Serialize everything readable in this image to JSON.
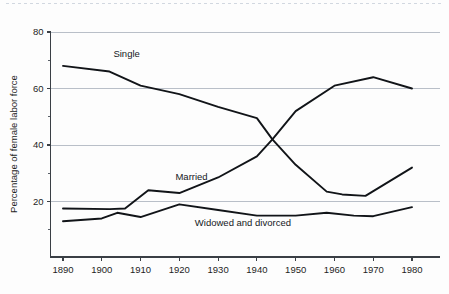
{
  "chart_data": {
    "type": "line",
    "title": "",
    "xlabel": "",
    "ylabel": "Percentage of female labor force",
    "xlim": [
      1886,
      1984
    ],
    "ylim": [
      0,
      80
    ],
    "ytick_labels": [
      "20",
      "40",
      "60",
      "80"
    ],
    "yticks": [
      20,
      40,
      60,
      80
    ],
    "y_minor_ticks": [
      10,
      30,
      50,
      70
    ],
    "xtick_labels": [
      "1890",
      "1900",
      "1910",
      "1920",
      "1930",
      "1940",
      "1950",
      "1960",
      "1970",
      "1980"
    ],
    "xticks": [
      1890,
      1900,
      1910,
      1920,
      1930,
      1940,
      1950,
      1960,
      1970,
      1980
    ],
    "grid": "horizontal-major-only",
    "legend": "inline-annotations",
    "line_color": "#111418",
    "grid_color": "#b9bfc8",
    "axis_color": "#3a3f45",
    "background": "#fdfdfd",
    "series": [
      {
        "name": "Single",
        "label": "Single",
        "label_x": 1903,
        "label_y": 71,
        "x": [
          1890,
          1902,
          1910,
          1920,
          1930,
          1940,
          1944,
          1950,
          1958,
          1962,
          1968,
          1980
        ],
        "values": [
          68,
          66,
          61,
          58,
          53.5,
          49.5,
          42,
          33,
          23.5,
          22.5,
          22,
          32
        ]
      },
      {
        "name": "Married",
        "label": "Married",
        "label_x": 1919,
        "label_y": 27.5,
        "x": [
          1890,
          1902,
          1906,
          1912,
          1920,
          1930,
          1940,
          1944,
          1950,
          1960,
          1970,
          1980
        ],
        "values": [
          17.5,
          17.3,
          17.5,
          24,
          23,
          28.5,
          36,
          42,
          52,
          61,
          64,
          60
        ]
      },
      {
        "name": "Widowed and divorced",
        "label": "Widowed and divorced",
        "label_x": 1924,
        "label_y": 11.5,
        "x": [
          1890,
          1900,
          1904,
          1910,
          1920,
          1930,
          1940,
          1950,
          1958,
          1965,
          1970,
          1980
        ],
        "values": [
          13,
          14,
          16,
          14.5,
          19,
          17,
          15,
          15,
          16,
          15,
          14.8,
          18
        ]
      }
    ]
  }
}
